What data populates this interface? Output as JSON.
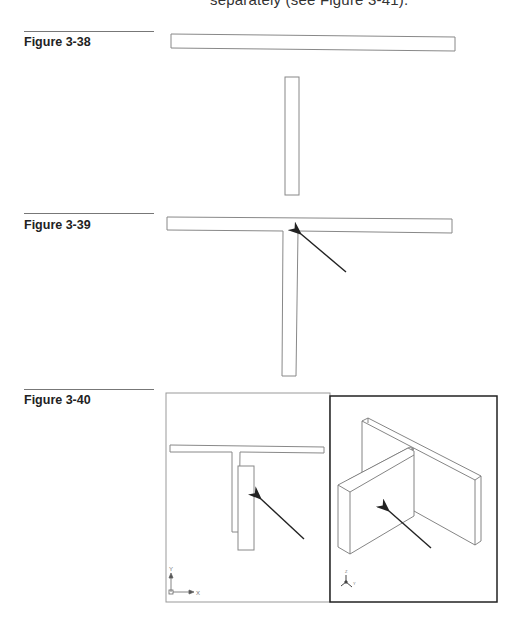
{
  "page": {
    "top_text": "separately (see Figure 3-41)."
  },
  "figures": [
    {
      "id": "fig-3-38",
      "label": "Figure 3-38",
      "description": "Horizontal bar and separate vertical bar (top view)"
    },
    {
      "id": "fig-3-39",
      "label": "Figure 3-39",
      "description": "Bars joined into T-shape with arrow pointing at inside corner"
    },
    {
      "id": "fig-3-40",
      "label": "Figure 3-40",
      "description": "Two viewports: plan view with offset panel and isometric 3D view",
      "viewports": [
        {
          "name": "top-view",
          "ucs_icon": {
            "x_label": "X",
            "y_label": "Y"
          }
        },
        {
          "name": "isometric-view",
          "ucs_icon": {
            "x_label": "X",
            "y_label": "Y",
            "z_label": "Z"
          }
        }
      ]
    }
  ],
  "colors": {
    "outline": "#888888",
    "arrow": "#222222",
    "frame": "#222222"
  }
}
